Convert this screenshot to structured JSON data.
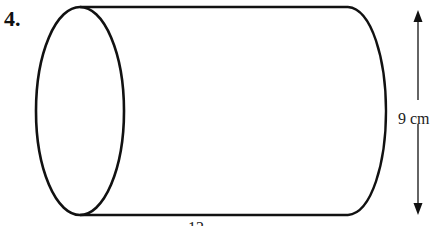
{
  "question": {
    "number": "4."
  },
  "figure": {
    "shape": "cylinder",
    "height_label": "9 cm",
    "length_label_partial": "12",
    "stroke_color": "#111111",
    "background": "#ffffff"
  }
}
